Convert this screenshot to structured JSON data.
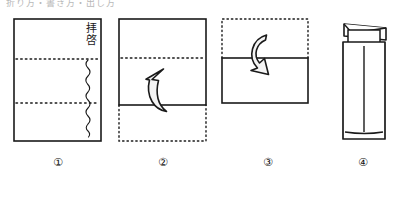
{
  "figure": {
    "top_caption": "折り方・書き方・出し方",
    "style": "hand-drawn line illustration",
    "ink_color": "#1a1a1a",
    "paper_color": "#ffffff"
  },
  "letter": {
    "salutation": "拝啓",
    "body_note": "本文（波線で表現）"
  },
  "steps": [
    {
      "number": "①",
      "name": "letter-sheet",
      "caption": "便箋を三つ折りにする位置で折り目をつける",
      "sheet": {
        "solid": true,
        "fold_lines": 2,
        "fold_line_style": "dotted"
      }
    },
    {
      "number": "②",
      "name": "fold-bottom-up",
      "caption": "下三分の一を上に折り上げる",
      "arrow": {
        "direction": "up",
        "name": "fold-up-arrow"
      }
    },
    {
      "number": "③",
      "name": "fold-top-down",
      "caption": "上三分の一を下に折り重ねる",
      "arrow": {
        "direction": "down",
        "name": "fold-down-arrow"
      }
    },
    {
      "number": "④",
      "name": "insert-into-envelope",
      "caption": "折った便箋を封筒に入れる",
      "envelope": {
        "flap": "open",
        "orientation": "vertical"
      }
    }
  ]
}
